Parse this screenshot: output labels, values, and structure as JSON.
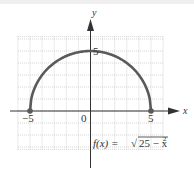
{
  "chart_data": {
    "type": "line",
    "title": "",
    "function_label": "f(x) = √(25 − x²)",
    "function_label_parts": {
      "prefix": "f(x) = ",
      "radicand": "25 − x",
      "exponent": "2"
    },
    "xlabel": "x",
    "ylabel": "y",
    "xlim": [
      -6,
      6
    ],
    "ylim": [
      -3.2,
      6.2
    ],
    "grid": true,
    "grid_step": 1,
    "tick_labels": {
      "x": [
        "−5",
        "0",
        "5"
      ],
      "y": [
        "5"
      ]
    },
    "endpoints": [
      {
        "x": -5,
        "y": 0
      },
      {
        "x": 5,
        "y": 0
      }
    ],
    "series": [
      {
        "name": "f(x) = sqrt(25 - x^2)",
        "x": [
          -5,
          -4,
          -3,
          -2,
          -1,
          0,
          1,
          2,
          3,
          4,
          5
        ],
        "y": [
          0,
          3,
          4,
          4.58,
          4.9,
          5,
          4.9,
          4.58,
          4,
          3,
          0
        ]
      }
    ]
  },
  "colors": {
    "curve": "#5a5a5a",
    "axis": "#333333",
    "grid": "#b8b8b8"
  }
}
